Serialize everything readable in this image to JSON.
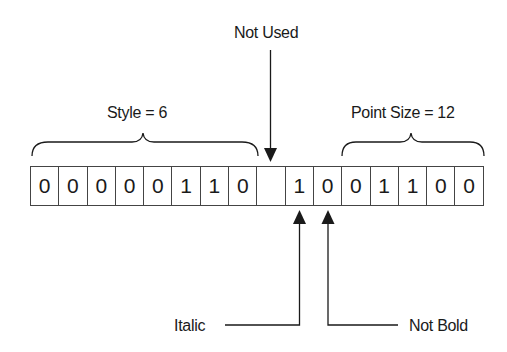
{
  "diagram": {
    "labels": {
      "not_used": "Not Used",
      "style": "Style = 6",
      "point_size": "Point Size = 12",
      "italic": "Italic",
      "not_bold": "Not Bold"
    },
    "bits": [
      "0",
      "0",
      "0",
      "0",
      "0",
      "1",
      "1",
      "0",
      "",
      "1",
      "0",
      "0",
      "1",
      "1",
      "0",
      "0"
    ],
    "groups": [
      {
        "name": "Style",
        "value": 6,
        "bit_range": [
          0,
          7
        ]
      },
      {
        "name": "Not Used",
        "bit_range": [
          8,
          8
        ]
      },
      {
        "name": "Italic",
        "bit_range": [
          9,
          9
        ],
        "value": 1
      },
      {
        "name": "Not Bold",
        "bit_range": [
          10,
          10
        ],
        "value": 0
      },
      {
        "name": "Point Size",
        "value": 12,
        "bit_range": [
          10,
          15
        ]
      }
    ],
    "line_color": "#1a1a1a"
  }
}
